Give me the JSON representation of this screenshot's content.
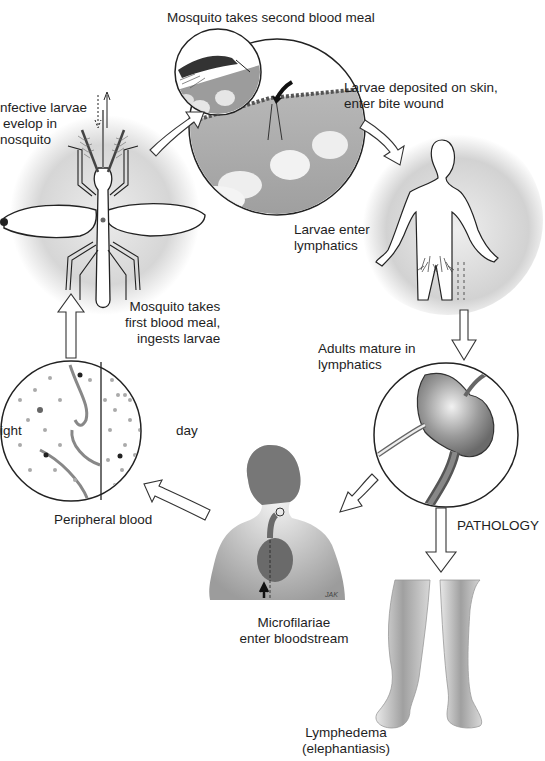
{
  "diagram": {
    "stages": [
      {
        "id": "second-blood-meal",
        "label": "Mosquito takes second blood meal"
      },
      {
        "id": "larvae-deposited",
        "label_lines": [
          "Larvae deposited on skin,",
          "enter bite wound"
        ]
      },
      {
        "id": "larvae-enter-lymphatics",
        "label_lines": [
          "Larvae enter",
          "lymphatics"
        ]
      },
      {
        "id": "adults-mature",
        "label_lines": [
          "Adults mature in",
          "lymphatics"
        ]
      },
      {
        "id": "microfilariae-bloodstream",
        "label_lines": [
          "Microfilariae",
          "enter bloodstream"
        ]
      },
      {
        "id": "peripheral-blood",
        "label": "Peripheral blood",
        "side_labels": {
          "left": "night",
          "left_visible": "ight",
          "right": "day"
        }
      },
      {
        "id": "first-blood-meal",
        "label_lines": [
          "Mosquito takes",
          "first blood meal,",
          "ingests larvae"
        ]
      },
      {
        "id": "infective-larvae",
        "label_lines": [
          "nfective larvae",
          "evelop in",
          "nosquito"
        ]
      }
    ],
    "pathology": {
      "label": "PATHOLOGY",
      "outcome_lines": [
        "Lymphedema",
        "(elephantiasis)"
      ]
    },
    "artist_signature": "JAK",
    "colors": {
      "background": "#ffffff",
      "line": "#1a1a1a",
      "halo": "#d9d9d9",
      "skin_tissue": "#a8a8a8",
      "figure_dark": "#7a7a7a"
    }
  }
}
